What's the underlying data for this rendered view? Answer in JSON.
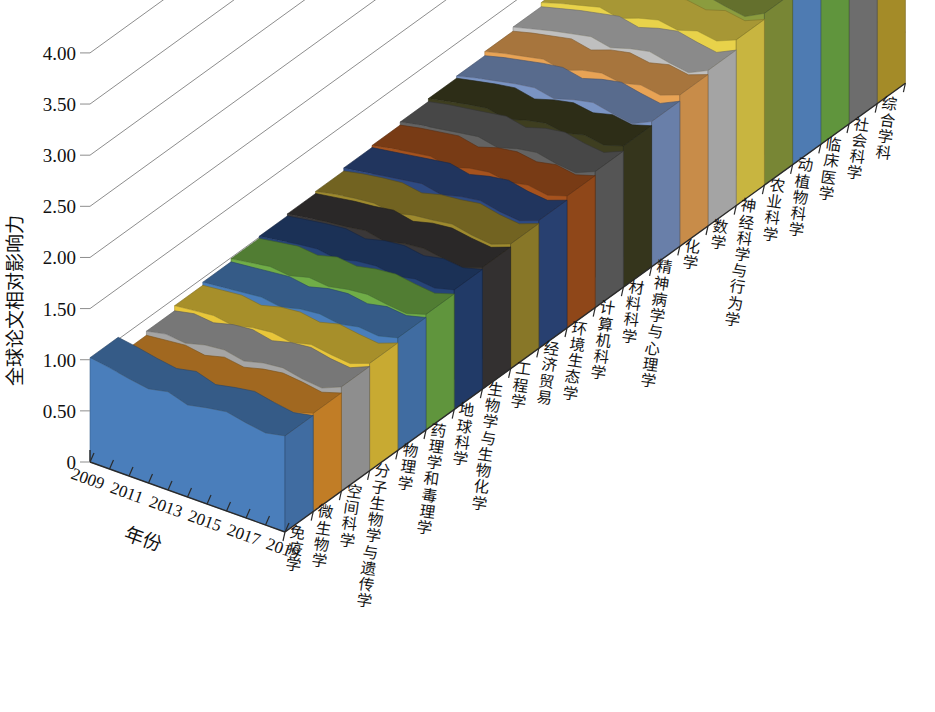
{
  "chart_data": {
    "type": "area",
    "subtype": "3d-stacked-ribbon",
    "title": "",
    "xlabel": "年份",
    "ylabel": "全球论文相对影响力",
    "x": [
      2009,
      2010,
      2011,
      2012,
      2013,
      2014,
      2015,
      2016,
      2017,
      2018,
      2019
    ],
    "x_tick_labels": [
      "2009",
      "2011",
      "2013",
      "2015",
      "2017",
      "2019"
    ],
    "y_tick_labels": [
      "0",
      "0.50",
      "1.00",
      "1.50",
      "2.00",
      "2.50",
      "3.00",
      "3.50",
      "4.00"
    ],
    "y_tick_values": [
      0,
      0.5,
      1.0,
      1.5,
      2.0,
      2.5,
      3.0,
      3.5,
      4.0
    ],
    "ylim": [
      0,
      4.4
    ],
    "grid": true,
    "legend": "none",
    "series_axis_label": "学科",
    "series": [
      {
        "name": "免疫学",
        "color": "#4A7EBB",
        "values": [
          1.02,
          0.99,
          0.95,
          0.92,
          0.96,
          0.9,
          0.94,
          0.97,
          0.93,
          0.9,
          0.94
        ]
      },
      {
        "name": "微生物学",
        "color": "#E0912C",
        "values": [
          0.84,
          0.86,
          0.88,
          0.85,
          0.9,
          0.87,
          0.92,
          0.95,
          0.93,
          0.9,
          0.96
        ]
      },
      {
        "name": "空间科学",
        "color": "#A5A5A5",
        "values": [
          0.88,
          0.92,
          0.9,
          0.95,
          0.97,
          0.93,
          0.98,
          1.0,
          0.96,
          0.94,
          1.02
        ]
      },
      {
        "name": "分子生物学与遗传学",
        "color": "#E8C63A",
        "values": [
          0.93,
          0.95,
          0.97,
          0.94,
          0.99,
          1.01,
          0.98,
          1.03,
          1.0,
          0.98,
          1.05
        ]
      },
      {
        "name": "物理学",
        "color": "#4A7EBB",
        "values": [
          0.96,
          0.98,
          1.0,
          1.02,
          0.99,
          1.04,
          1.06,
          1.03,
          1.07,
          1.05,
          1.1
        ]
      },
      {
        "name": "药理学和毒理学",
        "color": "#70AD47",
        "values": [
          0.99,
          1.02,
          1.05,
          1.03,
          1.08,
          1.06,
          1.1,
          1.12,
          1.09,
          1.07,
          1.13
        ]
      },
      {
        "name": "地球科学",
        "color": "#264478",
        "values": [
          1.01,
          1.04,
          1.07,
          1.09,
          1.06,
          1.11,
          1.13,
          1.1,
          1.14,
          1.12,
          1.17
        ]
      },
      {
        "name": "生物学与生物化学",
        "color": "#3B3838",
        "values": [
          1.03,
          1.06,
          1.09,
          1.11,
          1.14,
          1.1,
          1.15,
          1.17,
          1.14,
          1.12,
          1.19
        ]
      },
      {
        "name": "工程学",
        "color": "#9E8A2E",
        "values": [
          1.05,
          1.09,
          1.12,
          1.14,
          1.11,
          1.16,
          1.18,
          1.21,
          1.17,
          1.15,
          1.22
        ]
      },
      {
        "name": "经济贸易",
        "color": "#2E4A82",
        "values": [
          1.08,
          1.11,
          1.14,
          1.17,
          1.2,
          1.16,
          1.21,
          1.24,
          1.2,
          1.18,
          1.25
        ]
      },
      {
        "name": "环境生态学",
        "color": "#A6521D",
        "values": [
          1.1,
          1.14,
          1.17,
          1.2,
          1.16,
          1.22,
          1.25,
          1.22,
          1.26,
          1.23,
          1.29
        ]
      },
      {
        "name": "计算机科学",
        "color": "#636363",
        "values": [
          1.13,
          1.17,
          1.2,
          1.23,
          1.26,
          1.22,
          1.28,
          1.31,
          1.27,
          1.25,
          1.33
        ]
      },
      {
        "name": "材料科学",
        "color": "#3E3E20",
        "values": [
          1.16,
          1.2,
          1.24,
          1.27,
          1.23,
          1.29,
          1.33,
          1.3,
          1.35,
          1.32,
          1.38
        ]
      },
      {
        "name": "精神病学与心理学",
        "color": "#7A94C4",
        "values": [
          1.18,
          1.23,
          1.27,
          1.31,
          1.34,
          1.3,
          1.36,
          1.4,
          1.36,
          1.33,
          1.42
        ]
      },
      {
        "name": "化学",
        "color": "#E8A355",
        "values": [
          1.22,
          1.27,
          1.31,
          1.35,
          1.31,
          1.38,
          1.42,
          1.39,
          1.44,
          1.41,
          1.48
        ]
      },
      {
        "name": "数学",
        "color": "#BFBFBF",
        "values": [
          1.26,
          1.31,
          1.36,
          1.4,
          1.44,
          1.4,
          1.46,
          1.5,
          1.46,
          1.43,
          1.52
        ]
      },
      {
        "name": "神经科学与行为学",
        "color": "#E8D24A",
        "values": [
          1.3,
          1.36,
          1.41,
          1.46,
          1.42,
          1.49,
          1.54,
          1.51,
          1.57,
          1.54,
          1.62
        ]
      },
      {
        "name": "农业科学",
        "color": "#8B9C3E",
        "values": [
          1.35,
          1.41,
          1.47,
          1.52,
          1.57,
          1.53,
          1.6,
          1.65,
          1.61,
          1.58,
          1.68
        ]
      },
      {
        "name": "动植物科学",
        "color": "#5B8FCF",
        "values": [
          1.4,
          1.47,
          1.53,
          1.59,
          1.55,
          1.63,
          1.69,
          1.66,
          1.73,
          1.7,
          1.79
        ]
      },
      {
        "name": "临床医学",
        "color": "#70AD47",
        "values": [
          1.47,
          1.54,
          1.61,
          1.68,
          1.74,
          1.7,
          1.78,
          1.84,
          1.8,
          1.77,
          1.88
        ]
      },
      {
        "name": "社会科学",
        "color": "#7F7F7F",
        "values": [
          1.95,
          2.05,
          2.1,
          2.06,
          2.14,
          2.18,
          2.12,
          2.22,
          2.3,
          2.26,
          2.42
        ]
      },
      {
        "name": "综合学科",
        "color": "#BFA22E",
        "values": [
          2.02,
          4.26,
          2.38,
          3.92,
          2.3,
          3.3,
          2.62,
          3.26,
          2.92,
          3.1,
          3.56
        ]
      }
    ]
  },
  "axes": {
    "y_title": "全球论文相对影响力",
    "x_title": "年份"
  }
}
